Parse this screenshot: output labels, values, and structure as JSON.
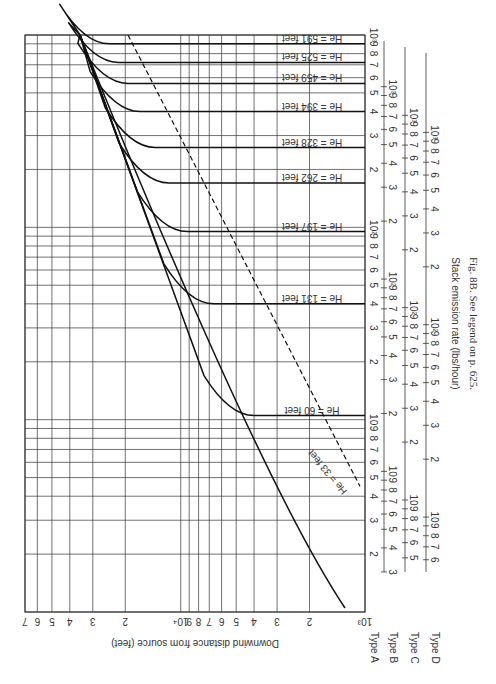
{
  "figure": {
    "caption": "Fig. 8B. See legend on p. 625.",
    "orientation": "rotated 90° clockwise (landscape figure on portrait page)"
  },
  "chart_data": {
    "type": "line",
    "title": "",
    "caption": "Fig. 8B. See legend on p. 625.",
    "xlabel": "Stack emission rate (lbs/hour)",
    "ylabel": "Downwind distance from source (feet)",
    "xscale": "log",
    "yscale": "log",
    "ylim": [
      1000,
      70000
    ],
    "y_ticks": [
      "10³",
      "2",
      "3",
      "4",
      "5",
      "6",
      "7",
      "8",
      "9",
      "10⁴",
      "2",
      "3",
      "4",
      "5",
      "6",
      "7"
    ],
    "x_axes": [
      {
        "name": "Type A",
        "range": [
          1,
          1000
        ],
        "ticks": [
          "2",
          "3",
          "4",
          "5",
          "6",
          "7",
          "8",
          "9",
          "10",
          "2",
          "3",
          "4",
          "5",
          "6",
          "7",
          "8",
          "9",
          "10²",
          "2",
          "3",
          "4",
          "5",
          "6",
          "7",
          "8",
          "9",
          "10³"
        ]
      },
      {
        "name": "Type B",
        "range": [
          2,
          1000
        ],
        "ticks": [
          "2",
          "3",
          "4",
          "5",
          "6",
          "7",
          "8",
          "9",
          "10",
          "2",
          "3",
          "4",
          "5",
          "6",
          "7",
          "8",
          "9",
          "10²",
          "2",
          "3",
          "4",
          "5",
          "6",
          "7",
          "8",
          "9",
          "10³"
        ]
      },
      {
        "name": "Type C",
        "range": [
          3,
          1000
        ],
        "ticks": [
          "2",
          "3",
          "4",
          "5",
          "6",
          "7",
          "8",
          "9",
          "10",
          "2",
          "3",
          "4",
          "5",
          "6",
          "7",
          "8",
          "9",
          "10²",
          "2",
          "3",
          "4",
          "5",
          "6",
          "7",
          "8",
          "9",
          "10³"
        ]
      },
      {
        "name": "Type D",
        "range": [
          4,
          1000
        ],
        "ticks": [
          "2",
          "3",
          "4",
          "5",
          "6",
          "7",
          "8",
          "9",
          "10",
          "2",
          "3",
          "4",
          "5",
          "6",
          "7",
          "8",
          "9",
          "10²",
          "2",
          "3",
          "4",
          "5",
          "6",
          "7",
          "8",
          "9",
          "10³"
        ]
      }
    ],
    "legend": [],
    "series": [
      {
        "name": "He = 33 feet",
        "height_ft": 33,
        "plateau_rate_A": null,
        "from_rate_A": 3.2,
        "from_dist": 1000
      },
      {
        "name": "He = 60 feet",
        "height_ft": 60,
        "plateau_rate_A": 10.5
      },
      {
        "name": "He = 131 feet",
        "height_ft": 131,
        "plateau_rate_A": 40
      },
      {
        "name": "He = 197 feet",
        "height_ft": 197,
        "plateau_rate_A": 95
      },
      {
        "name": "He = 262 feet",
        "height_ft": 262,
        "plateau_rate_A": 170
      },
      {
        "name": "He = 328 feet",
        "height_ft": 328,
        "plateau_rate_A": 260
      },
      {
        "name": "He = 394 feet",
        "height_ft": 394,
        "plateau_rate_A": 400
      },
      {
        "name": "He = 459 feet",
        "height_ft": 459,
        "plateau_rate_A": 560
      },
      {
        "name": "He = 525 feet",
        "height_ft": 525,
        "plateau_rate_A": 720
      },
      {
        "name": "He = 591 feet",
        "height_ft": 591,
        "plateau_rate_A": 900
      }
    ],
    "annotations": [
      "Dashed line: locus of maximum-concentration break points"
    ],
    "grid": true
  },
  "labels": {
    "ylabel": "Downwind distance from source (feet)",
    "xlabel": "Stack emission rate (lbs/hour)",
    "types": [
      "Type A",
      "Type B",
      "Type C",
      "Type D"
    ],
    "curves": [
      "He = 33 feet",
      "He = 60 feet",
      "He = 131 feet",
      "He = 197 feet",
      "He = 262 feet",
      "He = 328 feet",
      "He = 394 feet",
      "He = 459 feet",
      "He = 525 feet",
      "He = 591 feet"
    ]
  }
}
